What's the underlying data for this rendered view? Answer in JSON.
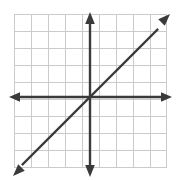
{
  "figure": {
    "width": 176,
    "height": 181,
    "background_color": "#ffffff"
  },
  "chart_data": {
    "type": "line",
    "title": "",
    "subtitle": "",
    "xlabel": "",
    "ylabel": "",
    "xlim": [
      -4.5,
      4.5
    ],
    "ylim": [
      -4.5,
      4.5
    ],
    "xticks": [
      -4,
      -3,
      -2,
      -1,
      0,
      1,
      2,
      3,
      4
    ],
    "yticks": [
      -4,
      -3,
      -2,
      -1,
      0,
      1,
      2,
      3,
      4
    ],
    "xtick_labels": [
      "",
      "",
      "",
      "",
      "",
      "",
      "",
      "",
      ""
    ],
    "ytick_labels": [
      "",
      "",
      "",
      "",
      "",
      "",
      "",
      "",
      ""
    ],
    "grid": true,
    "grid_color": "#cbcbcb",
    "grid_spacing_units": 1,
    "legend": null,
    "legend_position": "none",
    "axis_color": "#3a3a3a",
    "axes": {
      "x_axis": {
        "arrows": "both",
        "from": [
          -4.5,
          0
        ],
        "to": [
          4.5,
          0
        ]
      },
      "y_axis": {
        "arrows": "both",
        "from": [
          0,
          -4.5
        ],
        "to": [
          0,
          4.5
        ]
      }
    },
    "series": [
      {
        "name": "y = x",
        "color": "#3a3a3a",
        "slope": 1,
        "intercept": 0,
        "arrows": "both",
        "x": [
          -4.3,
          4.3
        ],
        "values": [
          -4.3,
          4.3
        ],
        "points": [
          [
            -4,
            -4
          ],
          [
            -3,
            -3
          ],
          [
            -2,
            -2
          ],
          [
            -1,
            -1
          ],
          [
            0,
            0
          ],
          [
            1,
            1
          ],
          [
            2,
            2
          ],
          [
            3,
            3
          ],
          [
            4,
            4
          ]
        ]
      }
    ],
    "annotations": []
  },
  "geometry": {
    "grid_left": 14,
    "grid_top": 14,
    "grid_right": 166,
    "grid_bottom": 168,
    "cell_size": 17,
    "origin_x": 90,
    "origin_y": 97,
    "x_axis_left_tip": 10,
    "x_axis_right_tip": 172,
    "y_axis_top_tip": 13,
    "y_axis_bottom_tip": 176,
    "line_top_right_tip": [
      170,
      14
    ],
    "line_bottom_left_tip": [
      13,
      176
    ]
  }
}
